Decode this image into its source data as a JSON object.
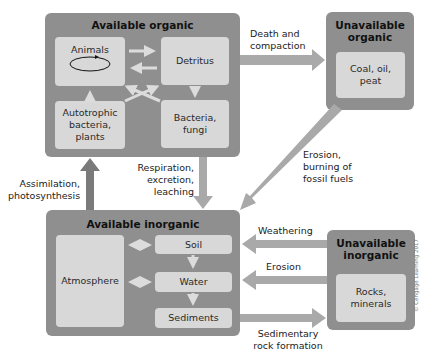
{
  "diagram": {
    "available_organic": {
      "title": "Available organic",
      "nodes": {
        "animals": "Animals",
        "detritus": "Detritus",
        "autotrophic": "Autotrophic bacteria, plants",
        "bacteria": "Bacteria, fungi"
      }
    },
    "unavailable_organic": {
      "title": "Unavailable organic",
      "nodes": {
        "coal": "Coal, oil, peat"
      }
    },
    "available_inorganic": {
      "title": "Available inorganic",
      "nodes": {
        "atmosphere": "Atmosphere",
        "soil": "Soil",
        "water": "Water",
        "sediments": "Sediments"
      }
    },
    "unavailable_inorganic": {
      "title": "Unavailable inorganic",
      "nodes": {
        "rocks": "Rocks, minerals"
      }
    },
    "flows": {
      "death": "Death and compaction",
      "respiration": "Respiration, excretion, leaching",
      "assimilation": "Assimilation, photosynthesis",
      "erosion_fossil": "Erosion, burning of fossil fuels",
      "weathering": "Weathering",
      "erosion": "Erosion",
      "sedimentary": "Sedimentary rock formation"
    },
    "copyright": "© Cengage Learning 2017"
  }
}
